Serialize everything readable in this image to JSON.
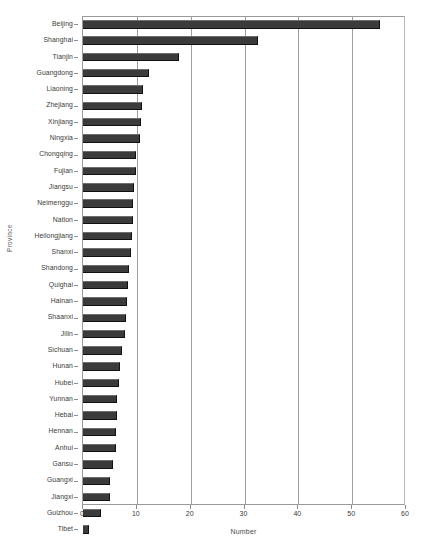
{
  "chart_data": {
    "type": "bar",
    "orientation": "horizontal",
    "title": "",
    "xlabel": "Number",
    "ylabel": "Province",
    "xlim": [
      0,
      60
    ],
    "ylim": null,
    "grid": true,
    "legend": false,
    "xticks": [
      0,
      10,
      20,
      30,
      40,
      50,
      60
    ],
    "categories": [
      "Beijing",
      "Shanghai",
      "Tianjin",
      "Guangdong",
      "Liaoning",
      "Zhejiang",
      "Xinjiang",
      "Ningxia",
      "Chongqing",
      "Fujian",
      "Jiangsu",
      "Neimenggu",
      "Nation",
      "Heilongjiang",
      "Shanxi",
      "Shandong",
      "Quighai",
      "Hainan",
      "Shaanxi",
      "Jilin",
      "Sichuan",
      "Hunan",
      "Hubei",
      "Yunnan",
      "Hebai",
      "Hennan",
      "Anhui",
      "Gansu",
      "Guangxi",
      "Jiangxi",
      "Guizhou",
      "Tibet"
    ],
    "values": [
      55.2,
      32.6,
      17.8,
      12.3,
      11.2,
      10.9,
      10.8,
      10.6,
      9.9,
      9.8,
      9.4,
      9.3,
      9.2,
      9.1,
      9.0,
      8.6,
      8.3,
      8.2,
      7.9,
      7.8,
      7.2,
      6.9,
      6.6,
      6.4,
      6.3,
      6.2,
      6.1,
      5.6,
      5.1,
      5.0,
      3.3,
      1.2
    ],
    "bar_color": "#3b3b3b",
    "grid_color": "#9e9e9e",
    "axis_color": "#9a9a9a"
  }
}
